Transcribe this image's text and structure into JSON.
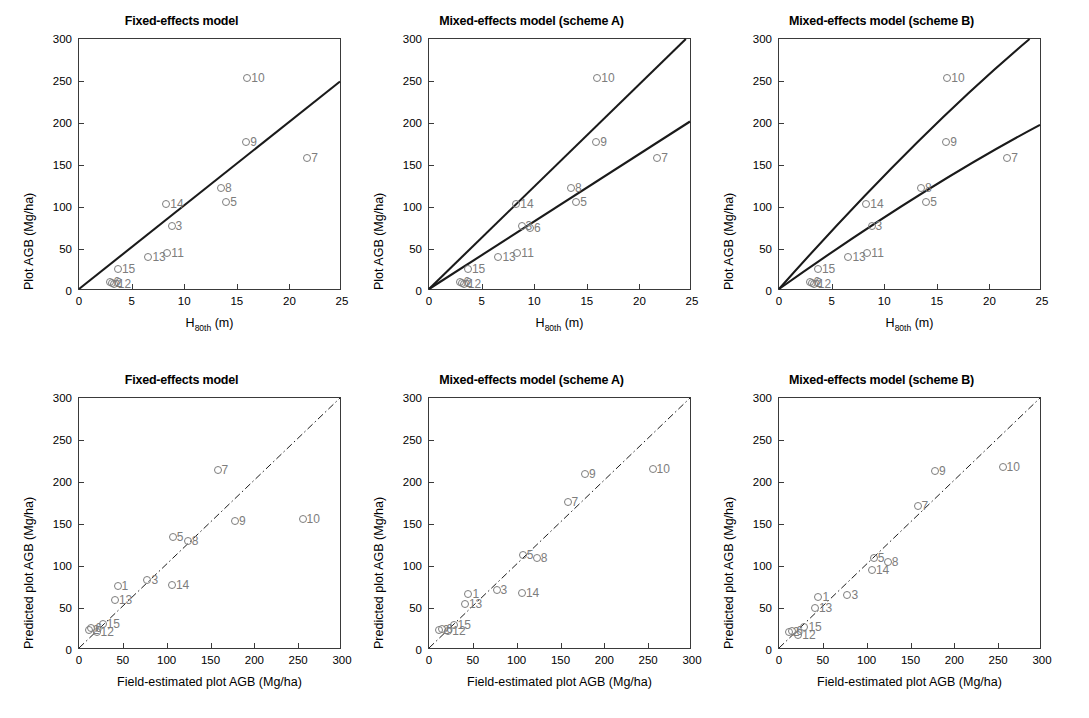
{
  "figure": {
    "marker_color": "#7d7d7d",
    "line_color": "#1a1a1a",
    "axis_color": "#3a3a3a"
  },
  "chart_data": [
    {
      "panel_id": "top-fixed-effects",
      "type": "scatter",
      "title": "Fixed-effects model",
      "xlabel": "H_80th (m)",
      "xlabel_base": "H",
      "xlabel_sub": "80th",
      "xlabel_unit": "(m)",
      "ylabel": "Plot AGB (Mg/ha)",
      "xlim": [
        0,
        25
      ],
      "ylim": [
        0,
        300
      ],
      "xticks": [
        0,
        5,
        10,
        15,
        20,
        25
      ],
      "yticks": [
        0,
        50,
        100,
        150,
        200,
        250,
        300
      ],
      "grid": false,
      "legend": "none",
      "points": [
        {
          "label": "2",
          "x": 3.1,
          "y": 9
        },
        {
          "label": "6",
          "x": 2.9,
          "y": 11
        },
        {
          "label": "12",
          "x": 3.3,
          "y": 8
        },
        {
          "label": "15",
          "x": 3.7,
          "y": 26
        },
        {
          "label": "13",
          "x": 6.6,
          "y": 40
        },
        {
          "label": "11",
          "x": 8.4,
          "y": 45
        },
        {
          "label": "14",
          "x": 8.3,
          "y": 104
        },
        {
          "label": "3",
          "x": 8.8,
          "y": 77
        },
        {
          "label": "8",
          "x": 13.5,
          "y": 123
        },
        {
          "label": "5",
          "x": 14.0,
          "y": 106
        },
        {
          "label": "10",
          "x": 16.0,
          "y": 254
        },
        {
          "label": "9",
          "x": 15.9,
          "y": 177
        },
        {
          "label": "7",
          "x": 21.7,
          "y": 158
        }
      ],
      "lines": [
        {
          "name": "fixed-effects-fit",
          "style": "solid",
          "x": [
            0,
            25
          ],
          "y": [
            0,
            249
          ]
        }
      ]
    },
    {
      "panel_id": "top-scheme-a",
      "type": "scatter",
      "title": "Mixed-effects model (scheme A)",
      "xlabel": "H_80th (m)",
      "xlabel_base": "H",
      "xlabel_sub": "80th",
      "xlabel_unit": "(m)",
      "ylabel": "Plot AGB (Mg/ha)",
      "xlim": [
        0,
        25
      ],
      "ylim": [
        0,
        300
      ],
      "xticks": [
        0,
        5,
        10,
        15,
        20,
        25
      ],
      "yticks": [
        0,
        50,
        100,
        150,
        200,
        250,
        300
      ],
      "grid": false,
      "legend": "none",
      "points": [
        {
          "label": "2",
          "x": 3.1,
          "y": 9
        },
        {
          "label": "6",
          "x": 2.9,
          "y": 11
        },
        {
          "label": "12",
          "x": 3.3,
          "y": 8
        },
        {
          "label": "15",
          "x": 3.7,
          "y": 26
        },
        {
          "label": "13",
          "x": 6.6,
          "y": 40
        },
        {
          "label": "11",
          "x": 8.4,
          "y": 45
        },
        {
          "label": "14",
          "x": 8.3,
          "y": 104
        },
        {
          "label": "3",
          "x": 8.8,
          "y": 77
        },
        {
          "label": "6b",
          "x": 9.6,
          "y": 75
        },
        {
          "label": "8",
          "x": 13.5,
          "y": 123
        },
        {
          "label": "5",
          "x": 14.0,
          "y": 106
        },
        {
          "label": "10",
          "x": 16.0,
          "y": 254
        },
        {
          "label": "9",
          "x": 15.9,
          "y": 177
        },
        {
          "label": "7",
          "x": 21.7,
          "y": 158
        }
      ],
      "lines": [
        {
          "name": "scheme-a-upper",
          "style": "solid",
          "x": [
            0,
            24.6
          ],
          "y": [
            0,
            300
          ]
        },
        {
          "name": "scheme-a-lower",
          "style": "solid",
          "x": [
            0,
            25
          ],
          "y": [
            0,
            201
          ]
        }
      ]
    },
    {
      "panel_id": "top-scheme-b",
      "type": "scatter",
      "title": "Mixed-effects model (scheme B)",
      "xlabel": "H_80th (m)",
      "xlabel_base": "H",
      "xlabel_sub": "80th",
      "xlabel_unit": "(m)",
      "ylabel": "Plot AGB (Mg/ha)",
      "xlim": [
        0,
        25
      ],
      "ylim": [
        0,
        300
      ],
      "xticks": [
        0,
        5,
        10,
        15,
        20,
        25
      ],
      "yticks": [
        0,
        50,
        100,
        150,
        200,
        250,
        300
      ],
      "grid": false,
      "legend": "none",
      "points": [
        {
          "label": "2",
          "x": 3.1,
          "y": 9
        },
        {
          "label": "6",
          "x": 2.9,
          "y": 11
        },
        {
          "label": "12",
          "x": 3.3,
          "y": 8
        },
        {
          "label": "15",
          "x": 3.7,
          "y": 26
        },
        {
          "label": "13",
          "x": 6.6,
          "y": 40
        },
        {
          "label": "11",
          "x": 8.4,
          "y": 45
        },
        {
          "label": "14",
          "x": 8.3,
          "y": 104
        },
        {
          "label": "3",
          "x": 8.8,
          "y": 77
        },
        {
          "label": "8",
          "x": 13.5,
          "y": 123
        },
        {
          "label": "5",
          "x": 14.0,
          "y": 106
        },
        {
          "label": "10",
          "x": 16.0,
          "y": 254
        },
        {
          "label": "9",
          "x": 15.9,
          "y": 177
        },
        {
          "label": "7",
          "x": 21.7,
          "y": 158
        }
      ],
      "lines": [
        {
          "name": "scheme-b-upper",
          "style": "solid_curved",
          "x": [
            0,
            24.0
          ],
          "y": [
            0,
            300
          ]
        },
        {
          "name": "scheme-b-lower",
          "style": "solid_curved",
          "x": [
            0,
            25
          ],
          "y": [
            0,
            197
          ]
        }
      ]
    },
    {
      "panel_id": "bottom-fixed-effects",
      "type": "scatter",
      "title": "Fixed-effects model",
      "xlabel": "Field-estimated plot AGB (Mg/ha)",
      "ylabel": "Predicted plot AGB (Mg/ha)",
      "xlim": [
        0,
        300
      ],
      "ylim": [
        0,
        300
      ],
      "xticks": [
        0,
        50,
        100,
        150,
        200,
        250,
        300
      ],
      "yticks": [
        0,
        50,
        100,
        150,
        200,
        250,
        300
      ],
      "grid": false,
      "legend": "none",
      "points": [
        {
          "label": "2",
          "x": 11,
          "y": 24
        },
        {
          "label": "6",
          "x": 14,
          "y": 26
        },
        {
          "label": "12",
          "x": 20,
          "y": 21
        },
        {
          "label": "15",
          "x": 27,
          "y": 31
        },
        {
          "label": "1",
          "x": 44,
          "y": 76
        },
        {
          "label": "13",
          "x": 41,
          "y": 60
        },
        {
          "label": "3",
          "x": 78,
          "y": 83
        },
        {
          "label": "14",
          "x": 106,
          "y": 77
        },
        {
          "label": "5",
          "x": 107,
          "y": 135
        },
        {
          "label": "8",
          "x": 124,
          "y": 130
        },
        {
          "label": "7",
          "x": 158,
          "y": 214
        },
        {
          "label": "9",
          "x": 178,
          "y": 153
        },
        {
          "label": "10",
          "x": 255,
          "y": 156
        }
      ],
      "lines": [
        {
          "name": "one-to-one",
          "style": "dashdot",
          "x": [
            0,
            300
          ],
          "y": [
            0,
            300
          ]
        }
      ]
    },
    {
      "panel_id": "bottom-scheme-a",
      "type": "scatter",
      "title": "Mixed-effects model (scheme A)",
      "xlabel": "Field-estimated plot AGB (Mg/ha)",
      "ylabel": "Predicted plot AGB (Mg/ha)",
      "xlim": [
        0,
        300
      ],
      "ylim": [
        0,
        300
      ],
      "xticks": [
        0,
        50,
        100,
        150,
        200,
        250,
        300
      ],
      "yticks": [
        0,
        50,
        100,
        150,
        200,
        250,
        300
      ],
      "grid": false,
      "legend": "none",
      "points": [
        {
          "label": "2",
          "x": 11,
          "y": 24
        },
        {
          "label": "6",
          "x": 15,
          "y": 25
        },
        {
          "label": "12",
          "x": 22,
          "y": 23
        },
        {
          "label": "15",
          "x": 28,
          "y": 30
        },
        {
          "label": "1",
          "x": 45,
          "y": 67
        },
        {
          "label": "13",
          "x": 41,
          "y": 55
        },
        {
          "label": "3",
          "x": 77,
          "y": 72
        },
        {
          "label": "14",
          "x": 106,
          "y": 68
        },
        {
          "label": "5",
          "x": 107,
          "y": 113
        },
        {
          "label": "8",
          "x": 123,
          "y": 109
        },
        {
          "label": "7",
          "x": 158,
          "y": 176
        },
        {
          "label": "9",
          "x": 178,
          "y": 210
        },
        {
          "label": "10",
          "x": 255,
          "y": 215
        }
      ],
      "lines": [
        {
          "name": "one-to-one",
          "style": "dashdot",
          "x": [
            0,
            300
          ],
          "y": [
            0,
            300
          ]
        }
      ]
    },
    {
      "panel_id": "bottom-scheme-b",
      "type": "scatter",
      "title": "Mixed-effects model (scheme B)",
      "xlabel": "Field-estimated plot AGB (Mg/ha)",
      "ylabel": "Predicted plot AGB (Mg/ha)",
      "xlim": [
        0,
        300
      ],
      "ylim": [
        0,
        300
      ],
      "xticks": [
        0,
        50,
        100,
        150,
        200,
        250,
        300
      ],
      "yticks": [
        0,
        50,
        100,
        150,
        200,
        250,
        300
      ],
      "grid": false,
      "legend": "none",
      "points": [
        {
          "label": "2",
          "x": 11,
          "y": 21
        },
        {
          "label": "6",
          "x": 15,
          "y": 23
        },
        {
          "label": "12",
          "x": 22,
          "y": 18
        },
        {
          "label": "15",
          "x": 29,
          "y": 27
        },
        {
          "label": "1",
          "x": 45,
          "y": 63
        },
        {
          "label": "13",
          "x": 41,
          "y": 50
        },
        {
          "label": "3",
          "x": 78,
          "y": 66
        },
        {
          "label": "14",
          "x": 106,
          "y": 95
        },
        {
          "label": "5",
          "x": 108,
          "y": 110
        },
        {
          "label": "8",
          "x": 124,
          "y": 105
        },
        {
          "label": "7",
          "x": 158,
          "y": 171
        },
        {
          "label": "9",
          "x": 178,
          "y": 213
        },
        {
          "label": "10",
          "x": 255,
          "y": 218
        }
      ],
      "lines": [
        {
          "name": "one-to-one",
          "style": "dashdot",
          "x": [
            0,
            300
          ],
          "y": [
            0,
            300
          ]
        }
      ]
    }
  ]
}
